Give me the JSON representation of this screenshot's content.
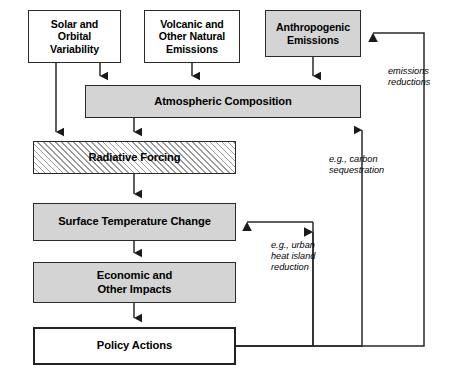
{
  "diagram": {
    "colors": {
      "gray_fill": "#d4d4d4",
      "white_fill": "#ffffff",
      "stroke": "#2a2a2a",
      "hatch_line": "#9a9a9a"
    },
    "nodes": {
      "solar": "Solar and\nOrbital\nVariability",
      "volcanic": "Volcanic and\nOther Natural\nEmissions",
      "anthropogenic": "Anthropogenic\nEmissions",
      "atmospheric": "Atmospheric Composition",
      "radiative": "Radiative Forcing",
      "surface_temp": "Surface Temperature Change",
      "economic": "Economic and\nOther Impacts",
      "policy": "Policy Actions"
    },
    "annotations": {
      "emissions_reductions": "emissions\nreductions",
      "carbon_sequestration": "e.g., carbon\nsequestration",
      "urban_heat": "e.g., urban\nheat island\nreduction"
    }
  }
}
